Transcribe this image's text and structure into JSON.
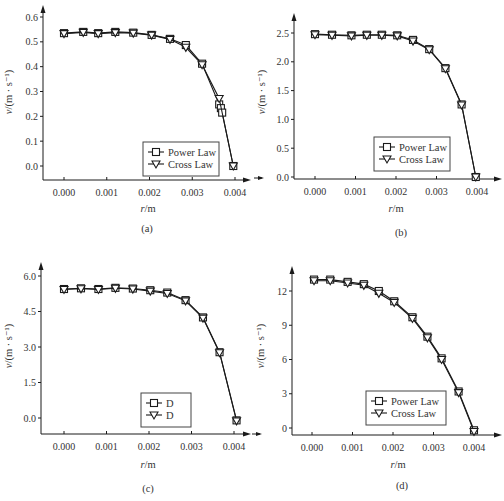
{
  "chart_data": [
    {
      "panel": "a",
      "type": "line",
      "caption": "(a)",
      "xlabel": "r/m",
      "ylabel": "v/(m · s⁻¹)",
      "x_ticks": [
        "0.000",
        "0.001",
        "0.002",
        "0.003",
        "0.004"
      ],
      "y_ticks": [
        "0.0",
        "0.1",
        "0.2",
        "0.3",
        "0.4",
        "0.5",
        "0.6"
      ],
      "xlim": [
        0.0,
        0.004
      ],
      "ylim": [
        0.0,
        0.6
      ],
      "grid": false,
      "legend_position": "lower right",
      "series": [
        {
          "name": "Power Law",
          "marker": "square",
          "x": [
            0.0,
            0.00045,
            0.0008,
            0.0012,
            0.00162,
            0.00205,
            0.00248,
            0.00285,
            0.00323,
            0.00363,
            0.00367,
            0.0037,
            0.00396
          ],
          "y": [
            0.535,
            0.54,
            0.535,
            0.54,
            0.537,
            0.528,
            0.512,
            0.487,
            0.412,
            0.248,
            0.233,
            0.215,
            0.0
          ]
        },
        {
          "name": "Cross Law",
          "marker": "triangle-down",
          "x": [
            0.0,
            0.00045,
            0.0008,
            0.0012,
            0.00162,
            0.00205,
            0.00248,
            0.00285,
            0.00323,
            0.00363,
            0.00396
          ],
          "y": [
            0.533,
            0.538,
            0.533,
            0.537,
            0.535,
            0.527,
            0.51,
            0.478,
            0.408,
            0.272,
            0.0
          ]
        }
      ]
    },
    {
      "panel": "b",
      "type": "line",
      "caption": "(b)",
      "xlabel": "r/m",
      "ylabel": "v/(m · s⁻¹)",
      "x_ticks": [
        "0.000",
        "0.001",
        "0.002",
        "0.003",
        "0.004"
      ],
      "y_ticks": [
        "0.0",
        "0.5",
        "1.0",
        "1.5",
        "2.0",
        "2.5"
      ],
      "xlim": [
        0.0,
        0.004
      ],
      "ylim": [
        0.0,
        2.5
      ],
      "grid": false,
      "legend_position": "lower right",
      "series": [
        {
          "name": "Power Law",
          "marker": "square",
          "x": [
            0.0,
            0.00042,
            0.0009,
            0.00128,
            0.00165,
            0.00203,
            0.00242,
            0.00282,
            0.00322,
            0.00362,
            0.00397
          ],
          "y": [
            2.48,
            2.47,
            2.46,
            2.47,
            2.47,
            2.46,
            2.38,
            2.22,
            1.89,
            1.26,
            0.0
          ]
        },
        {
          "name": "Cross Law",
          "marker": "triangle-down",
          "x": [
            0.0,
            0.00042,
            0.0009,
            0.00128,
            0.00165,
            0.00203,
            0.00242,
            0.00282,
            0.00322,
            0.00362,
            0.00397
          ],
          "y": [
            2.47,
            2.46,
            2.45,
            2.46,
            2.46,
            2.45,
            2.36,
            2.21,
            1.88,
            1.25,
            0.0
          ]
        }
      ]
    },
    {
      "panel": "c",
      "type": "line",
      "caption": "(c)",
      "xlabel": "r/m",
      "ylabel": "v/(m · s⁻¹)",
      "x_ticks": [
        "0.000",
        "0.001",
        "0.002",
        "0.003",
        "0.004"
      ],
      "y_ticks": [
        "0.0",
        "1.5",
        "3.0",
        "4.5",
        "6.0"
      ],
      "xlim": [
        0.0,
        0.004
      ],
      "ylim": [
        0.0,
        6.0
      ],
      "grid": false,
      "legend_position": "lower right",
      "series": [
        {
          "name": "D",
          "marker": "square",
          "x": [
            0.0,
            0.0004,
            0.00081,
            0.00121,
            0.00162,
            0.00203,
            0.00243,
            0.00286,
            0.00327,
            0.00366,
            0.00406
          ],
          "y": [
            5.45,
            5.48,
            5.45,
            5.5,
            5.47,
            5.4,
            5.3,
            4.98,
            4.25,
            2.78,
            -0.1
          ]
        },
        {
          "name": "D",
          "marker": "triangle-down",
          "x": [
            0.0,
            0.0004,
            0.00081,
            0.00121,
            0.00162,
            0.00203,
            0.00243,
            0.00286,
            0.00327,
            0.00366,
            0.00406
          ],
          "y": [
            5.43,
            5.46,
            5.43,
            5.48,
            5.45,
            5.36,
            5.26,
            4.95,
            4.22,
            2.76,
            -0.12
          ]
        }
      ]
    },
    {
      "panel": "d",
      "type": "line",
      "caption": "(d)",
      "xlabel": "r/m",
      "ylabel": "v/(m · s⁻¹)",
      "x_ticks": [
        "0.000",
        "0.001",
        "0.002",
        "0.003",
        "0.004"
      ],
      "y_ticks": [
        "0",
        "3",
        "6",
        "9",
        "12"
      ],
      "xlim": [
        0.0,
        0.004
      ],
      "ylim": [
        0,
        12
      ],
      "grid": false,
      "legend_position": "lower right",
      "series": [
        {
          "name": "Power Law",
          "marker": "square",
          "x": [
            5e-05,
            0.00045,
            0.00088,
            0.00128,
            0.00165,
            0.00203,
            0.00248,
            0.00285,
            0.0032,
            0.00362,
            0.004
          ],
          "y": [
            13.0,
            13.0,
            12.8,
            12.6,
            12.0,
            11.1,
            9.7,
            8.0,
            6.1,
            3.2,
            -0.2
          ]
        },
        {
          "name": "Cross Law",
          "marker": "triangle-down",
          "x": [
            5e-05,
            0.00045,
            0.00088,
            0.00128,
            0.00165,
            0.00203,
            0.00248,
            0.00285,
            0.0032,
            0.00362,
            0.004
          ],
          "y": [
            12.9,
            12.9,
            12.7,
            12.5,
            11.8,
            11.0,
            9.6,
            7.9,
            6.0,
            3.1,
            -0.3
          ]
        }
      ]
    }
  ]
}
